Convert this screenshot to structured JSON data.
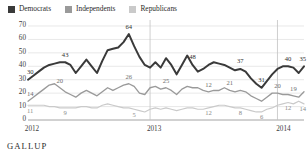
{
  "brand": "GALLUP",
  "legend": {
    "position": "top-left",
    "items": [
      {
        "label": "Democrats",
        "color": "#3a3a3a",
        "key": "democrats"
      },
      {
        "label": "Independents",
        "color": "#9a9a9a",
        "key": "independents"
      },
      {
        "label": "Republicans",
        "color": "#cacaca",
        "key": "republicans"
      }
    ]
  },
  "axis": {
    "y_ticks": [
      "0",
      "10",
      "20",
      "30",
      "40",
      "50",
      "60",
      "70"
    ],
    "x_ticks": [
      "2012",
      "2013",
      "2014"
    ]
  },
  "chart_data": {
    "type": "line",
    "title": "",
    "subtitle": "",
    "xlabel": "",
    "ylabel": "",
    "ylim": [
      0,
      70
    ],
    "ytick_step": 10,
    "grid": true,
    "legend_position": "top-left",
    "x": [
      "2012-1",
      "2012-2",
      "2012-3",
      "2012-4",
      "2012-5",
      "2012-6",
      "2012-7",
      "2012-8",
      "2012-9",
      "2012-10",
      "2012-11",
      "2012-12",
      "2012-13",
      "2012-14",
      "2012-15",
      "2012-16",
      "2012-17",
      "2012-18",
      "2012-19",
      "2012-20",
      "2012-21",
      "2012-22",
      "2012-23",
      "2013-1",
      "2013-2",
      "2013-3",
      "2013-4",
      "2013-5",
      "2013-6",
      "2013-7",
      "2013-8",
      "2013-9",
      "2013-10",
      "2013-11",
      "2013-12",
      "2013-13",
      "2013-14",
      "2013-15",
      "2013-16",
      "2013-17",
      "2013-18",
      "2013-19",
      "2013-20",
      "2013-21",
      "2013-22",
      "2013-23",
      "2013-24",
      "2014-1",
      "2014-2",
      "2014-3",
      "2014-4",
      "2014-5",
      "2014-6"
    ],
    "series": [
      {
        "name": "Democrats",
        "color": "#3a3a3a",
        "values": [
          30,
          33,
          36,
          39,
          41,
          42,
          43,
          43,
          41,
          35,
          40,
          45,
          40,
          35,
          44,
          52,
          53,
          54,
          58,
          64,
          55,
          47,
          41,
          39,
          43,
          39,
          46,
          41,
          34,
          41,
          48,
          41,
          36,
          38,
          41,
          43,
          42,
          41,
          39,
          37,
          38,
          36,
          31,
          27,
          24,
          29,
          34,
          38,
          40,
          40,
          39,
          35,
          40
        ],
        "labels": [
          {
            "index": 0,
            "text": "30"
          },
          {
            "index": 7,
            "text": "43"
          },
          {
            "index": 19,
            "text": "64"
          },
          {
            "index": 31,
            "text": "48"
          },
          {
            "index": 40,
            "text": "37"
          },
          {
            "index": 44,
            "text": "31"
          },
          {
            "index": 49,
            "text": "40"
          },
          {
            "index": 52,
            "text": "35"
          },
          {
            "index": 53,
            "text": "40"
          }
        ]
      },
      {
        "name": "Independents",
        "color": "#9a9a9a",
        "values": [
          14,
          17,
          20,
          23,
          26,
          27,
          24,
          21,
          19,
          17,
          20,
          22,
          20,
          18,
          21,
          24,
          22,
          24,
          26,
          27,
          25,
          20,
          19,
          24,
          25,
          23,
          24,
          22,
          19,
          23,
          25,
          24,
          24,
          22,
          21,
          22,
          22,
          24,
          22,
          21,
          22,
          21,
          18,
          16,
          14,
          17,
          20,
          20,
          19,
          19,
          18,
          17,
          21
        ],
        "labels": [
          {
            "index": 0,
            "text": "14"
          },
          {
            "index": 6,
            "text": "20"
          },
          {
            "index": 19,
            "text": "26"
          },
          {
            "index": 26,
            "text": "25"
          },
          {
            "index": 34,
            "text": "12"
          },
          {
            "index": 38,
            "text": "21"
          },
          {
            "index": 47,
            "text": "20"
          },
          {
            "index": 50,
            "text": "19"
          },
          {
            "index": 53,
            "text": "21"
          }
        ]
      },
      {
        "name": "Republicans",
        "color": "#cacaca",
        "values": [
          11,
          11,
          11,
          11,
          10,
          10,
          9,
          9,
          9,
          9,
          10,
          10,
          9,
          9,
          11,
          12,
          11,
          10,
          9,
          9,
          8,
          7,
          6,
          8,
          9,
          8,
          9,
          8,
          7,
          8,
          9,
          9,
          8,
          8,
          9,
          10,
          11,
          11,
          10,
          9,
          9,
          8,
          7,
          6,
          6,
          8,
          9,
          11,
          12,
          13,
          12,
          14,
          12
        ],
        "labels": [
          {
            "index": 0,
            "text": "11"
          },
          {
            "index": 7,
            "text": "9"
          },
          {
            "index": 20,
            "text": "5"
          },
          {
            "index": 34,
            "text": "12"
          },
          {
            "index": 40,
            "text": "8"
          },
          {
            "index": 44,
            "text": "6"
          },
          {
            "index": 49,
            "text": "12"
          },
          {
            "index": 52,
            "text": "14"
          },
          {
            "index": 53,
            "text": "12"
          }
        ]
      }
    ],
    "year_dividers": [
      "2013-1",
      "2014-1"
    ]
  }
}
